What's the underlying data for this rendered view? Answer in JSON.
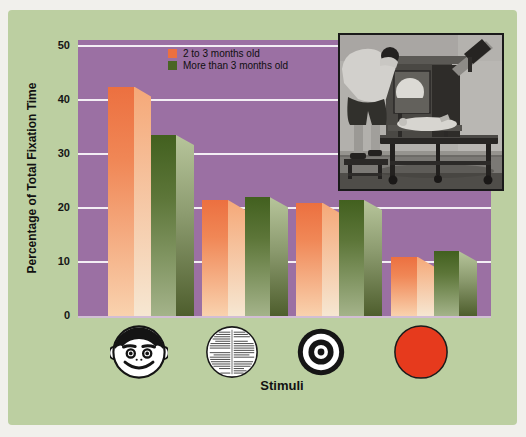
{
  "figure": {
    "panel_color": "#bccfa1",
    "plot_color": "#9b70a3",
    "page_bg": "#f1f0ec"
  },
  "chart_data": {
    "type": "bar",
    "title": "",
    "xlabel": "Stimuli",
    "ylabel": "Percentage of Total Fixation Time",
    "ylim": [
      0,
      50
    ],
    "yticks": [
      0,
      10,
      20,
      30,
      40,
      50
    ],
    "grid": true,
    "grid_color": "#ffffff",
    "legend_position": "top-inside",
    "categories": [
      "smiling face",
      "newsprint patch",
      "bullseye",
      "plain red disc"
    ],
    "series": [
      {
        "name": "2 to 3 months old",
        "color_top": "#ec7040",
        "color_bottom": "#f9d2ae",
        "values": [
          42.5,
          21.5,
          21,
          11
        ]
      },
      {
        "name": "More than 3 months old",
        "color_top": "#42601f",
        "color_bottom": "#a4b38a",
        "values": [
          33.5,
          22,
          21.5,
          12
        ]
      }
    ]
  },
  "stimuli": {
    "icon_names": [
      "face-stimulus-icon",
      "newsprint-stimulus-icon",
      "bullseye-stimulus-icon",
      "red-disc-stimulus-icon"
    ],
    "red_disc_color": "#e63a1d"
  },
  "inset": {
    "name": "looking-chamber-photo"
  }
}
